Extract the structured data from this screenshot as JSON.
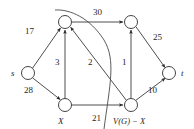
{
  "figure": {
    "background_color": "#ffffff",
    "line_color": "#3a3a3a",
    "text_color": "#252525"
  },
  "nodes": [
    {
      "id": "s",
      "label": "s",
      "cx": 28,
      "cy": 73,
      "r": 6.5,
      "label_x": 11,
      "label_y": 69
    },
    {
      "id": "top_left",
      "label": "",
      "cx": 65,
      "cy": 22,
      "r": 6.5,
      "label_x": 0,
      "label_y": 0
    },
    {
      "id": "top_right",
      "label": "",
      "cx": 131,
      "cy": 22,
      "r": 6.5,
      "label_x": 0,
      "label_y": 0
    },
    {
      "id": "x",
      "label": "X",
      "cx": 65,
      "cy": 105,
      "r": 6.5,
      "label_x": 58,
      "label_y": 117
    },
    {
      "id": "vgx",
      "label": "V(G) − X",
      "cx": 131,
      "cy": 105,
      "r": 6.5,
      "label_x": 116,
      "label_y": 117
    },
    {
      "id": "t",
      "label": "t",
      "cx": 169,
      "cy": 73,
      "r": 6.5,
      "label_x": 181,
      "label_y": 69
    }
  ],
  "edges": [
    {
      "from": "s",
      "to": "top_left",
      "capacity": "17",
      "label_x": 25,
      "label_y": 27
    },
    {
      "from": "s",
      "to": "x",
      "capacity": "28",
      "label_x": 24,
      "label_y": 86
    },
    {
      "from": "x",
      "to": "top_left",
      "capacity": "3",
      "label_x": 55,
      "label_y": 58
    },
    {
      "from": "vgx",
      "to": "top_left",
      "capacity": "2",
      "label_x": 88,
      "label_y": 58
    },
    {
      "from": "vgx",
      "to": "top_right",
      "capacity": "1",
      "label_x": 122,
      "label_y": 58
    },
    {
      "from": "top_left",
      "to": "top_right",
      "capacity": "30",
      "label_x": 93,
      "label_y": 8
    },
    {
      "from": "top_right",
      "to": "t",
      "capacity": "25",
      "label_x": 153,
      "label_y": 33
    },
    {
      "from": "vgx",
      "to": "t",
      "capacity": "10",
      "label_x": 148,
      "label_y": 86
    },
    {
      "from": "x",
      "to": "vgx",
      "capacity": "21",
      "label_x": 92,
      "label_y": 114
    }
  ],
  "cut_curve": {
    "name": "cut-boundary-curve",
    "description": "free-hand arc separating X side from V(G) - X side"
  }
}
